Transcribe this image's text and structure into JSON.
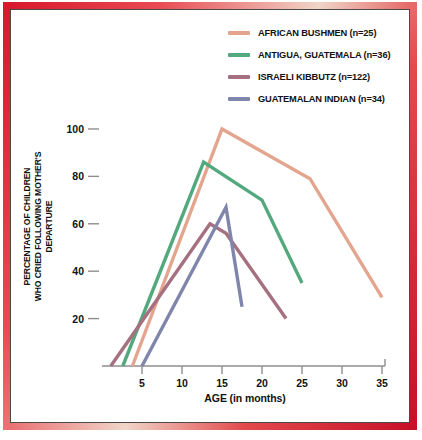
{
  "theme": {
    "border_color": "#d8192c",
    "background": "#ffffff",
    "axis_color": "#8e8e8e",
    "text_color": "#121212"
  },
  "legend": {
    "position": "top-right",
    "entries": [
      {
        "label": "AFRICAN BUSHMEN (n=25)",
        "color": "#e3a58e",
        "name": "african-bushmen"
      },
      {
        "label": "ANTIGUA, GUATEMALA (n=36)",
        "color": "#54a87e",
        "name": "antigua-guatemala"
      },
      {
        "label": "ISRAELI KIBBUTZ (n=122)",
        "color": "#a5707f",
        "name": "israeli-kibbutz"
      },
      {
        "label": "GUATEMALAN INDIAN (n=34)",
        "color": "#8085ab",
        "name": "guatemalan-indian"
      }
    ]
  },
  "axes": {
    "x_label": "AGE (in months)",
    "y_label_line1": "PERCENTAGE OF CHILDREN",
    "y_label_line2": "WHO CRIED FOLLOWING MOTHER'S DEPARTURE",
    "x_ticks": [
      5,
      10,
      15,
      20,
      25,
      30,
      35
    ],
    "y_ticks": [
      20,
      40,
      60,
      80,
      100
    ]
  },
  "chart_data": {
    "type": "line",
    "title": "",
    "xlabel": "AGE (in months)",
    "ylabel": "PERCENTAGE OF CHILDREN WHO CRIED FOLLOWING MOTHER'S DEPARTURE",
    "xlim": [
      0,
      36
    ],
    "ylim": [
      0,
      108
    ],
    "grid": false,
    "legend_position": "top-right",
    "x_ticks": [
      5,
      10,
      15,
      20,
      25,
      30,
      35
    ],
    "y_ticks": [
      20,
      40,
      60,
      80,
      100
    ],
    "series": [
      {
        "name": "AFRICAN BUSHMEN (n=25)",
        "color": "#e3a58e",
        "n": 25,
        "points": [
          {
            "x": 3.8,
            "y": 0
          },
          {
            "x": 15.0,
            "y": 100
          },
          {
            "x": 26.0,
            "y": 79
          },
          {
            "x": 35.0,
            "y": 29
          }
        ]
      },
      {
        "name": "ANTIGUA, GUATEMALA (n=36)",
        "color": "#54a87e",
        "n": 36,
        "points": [
          {
            "x": 2.6,
            "y": 0
          },
          {
            "x": 12.7,
            "y": 86
          },
          {
            "x": 20.0,
            "y": 70
          },
          {
            "x": 25.0,
            "y": 35
          }
        ]
      },
      {
        "name": "ISRAELI KIBBUTZ (n=122)",
        "color": "#a5707f",
        "n": 122,
        "points": [
          {
            "x": 1.1,
            "y": 0
          },
          {
            "x": 13.5,
            "y": 60
          },
          {
            "x": 15.5,
            "y": 56
          },
          {
            "x": 23.0,
            "y": 20
          }
        ]
      },
      {
        "name": "GUATEMALAN INDIAN (n=34)",
        "color": "#8085ab",
        "n": 34,
        "points": [
          {
            "x": 5.0,
            "y": 0
          },
          {
            "x": 15.5,
            "y": 67
          },
          {
            "x": 17.5,
            "y": 25
          }
        ]
      }
    ]
  }
}
